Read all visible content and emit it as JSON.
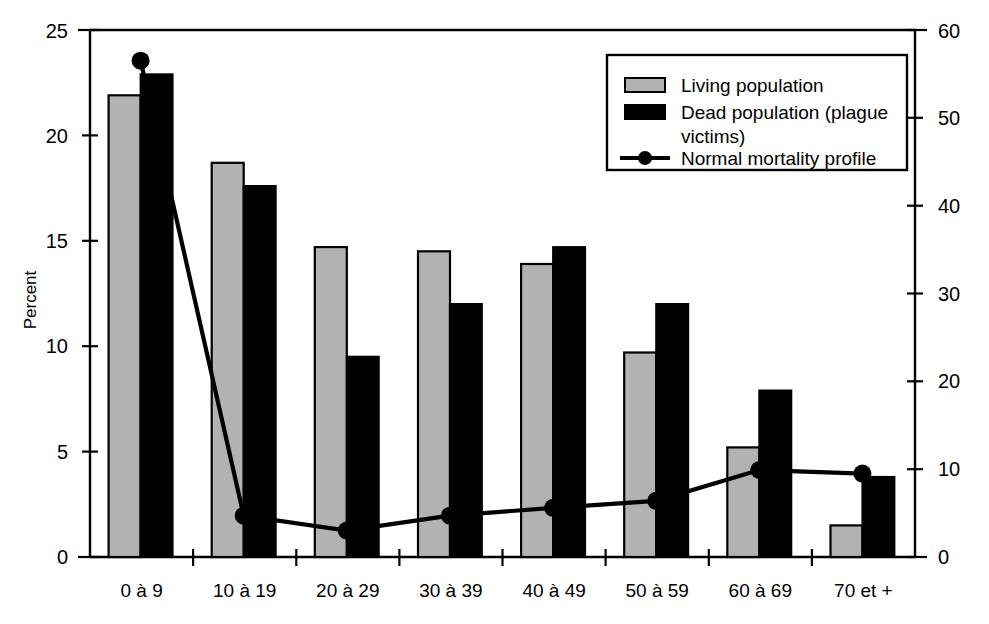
{
  "chart_data": {
    "type": "bar",
    "title": "",
    "subtitle": "",
    "xlabel": "",
    "ylabel": "Percent",
    "y2label": "",
    "categories": [
      "0 à 9",
      "10 à 19",
      "20 à 29",
      "30 à 39",
      "40 à 49",
      "50 à 59",
      "60 à 69",
      "70 et +"
    ],
    "ylim": [
      0,
      25
    ],
    "yticks": [
      0,
      5,
      10,
      15,
      20,
      25
    ],
    "y2lim": [
      0,
      60
    ],
    "y2ticks": [
      0,
      10,
      20,
      30,
      40,
      50,
      60
    ],
    "grid": false,
    "legend_position": "top-right",
    "series": [
      {
        "name": "Living population",
        "kind": "bar",
        "axis": "left",
        "color": "#b2b2b2",
        "values": [
          21.9,
          18.7,
          14.7,
          14.5,
          13.9,
          9.7,
          5.2,
          1.5
        ]
      },
      {
        "name": "Dead population (plague victims)",
        "kind": "bar",
        "axis": "left",
        "color": "#000000",
        "values": [
          22.9,
          17.6,
          9.5,
          12.0,
          14.7,
          12.0,
          7.9,
          3.8
        ]
      },
      {
        "name": "Normal mortality profile",
        "kind": "line",
        "axis": "right",
        "color": "#000000",
        "values": [
          56.5,
          4.7,
          3.0,
          4.7,
          5.6,
          6.4,
          9.9,
          9.5
        ]
      }
    ]
  },
  "legend": {
    "items": [
      {
        "label": "Living population",
        "marker": "gray-swatch"
      },
      {
        "label": "Dead population (plague",
        "marker": "black-swatch"
      },
      {
        "label": "victims)",
        "marker": "none"
      },
      {
        "label": "Normal mortality profile",
        "marker": "line-dot"
      }
    ]
  },
  "axes": {
    "left_title": "Percent",
    "left_ticks": [
      "0",
      "5",
      "10",
      "15",
      "20",
      "25"
    ],
    "right_ticks": [
      "0",
      "10",
      "20",
      "30",
      "40",
      "50",
      "60"
    ]
  }
}
